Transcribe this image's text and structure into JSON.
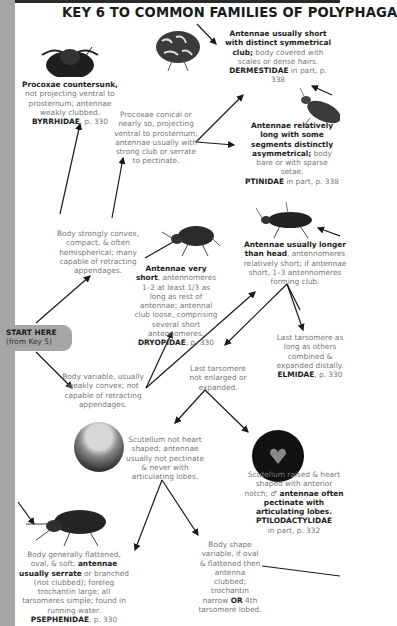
{
  "page": {
    "title": "KEY 6 TO COMMON FAMILIES OF POLYPHAGA",
    "colors": {
      "sidebar": "#a6a6a6",
      "text_bold": "#1c1c1c",
      "text_muted": "#777777",
      "arrow": "#1a1a1a"
    }
  },
  "start": {
    "label": "START HERE",
    "sub": "(from Key 5)"
  },
  "nodes": {
    "convex": "Body strongly convex, compact, & often hemispherical; many capable of retracting appendages.",
    "variable": "Body variable, usually weakly convex; not capable of retracting appendages.",
    "procoxae_conical": "Procoxae conical or nearly so, projecting ventral to prosternum; antennae usually with strong club or serrate to pectinate.",
    "byrrhidae": {
      "bold": "Procoxae countersunk,",
      "text": "not projecting ventral to prosternum; antennae weakly clubbed.",
      "family": "BYRRHIDAE",
      "page": ", p. 330"
    },
    "dermestidae": {
      "bold": "Antennae usually short with distinct symmetrical club;",
      "text": "body covered with scales or dense hairs.",
      "family": "DERMESTIDAE",
      "page": " in part, p. 338"
    },
    "ptinidae": {
      "bold": "Antennae relatively long with some segments distinctly asymmetrical;",
      "text": "body bare or with sparse setae.",
      "family": "PTINIDAE",
      "page": " in part, p. 338"
    },
    "dryopidae": {
      "bold": "Antennae very short",
      "text": ", antennomeres 1–2 at least 1/3 as long as rest of antennae; antennal club loose, comprising several short antennomeres.",
      "family": "DRYOPIDAE",
      "page": ", p. 330"
    },
    "antennae_longer": {
      "bold": "Antennae usually longer than head",
      "text": ", antennomeres relatively short; if antennae short, 1–3 antennomeres forming club."
    },
    "last_tarsomere_not": "Last tarsomere not enlarged or expanded.",
    "elmidae": {
      "text": "Last tarsomere as long as others combined & expanded distally.",
      "family": "ELMIDAE",
      "page": ", p. 330"
    },
    "scutellum_not_heart": "Scutellum not heart shaped; antennae usually not pectinate & never with articulating lobes.",
    "ptilodactylidae": {
      "text": "Scutellum raised & heart shaped with anterior notch;",
      "symbol": "♂",
      "bold": " antennae often pectinate with articulating lobes.",
      "family": "PTILODACTYLIDAE",
      "page": "in part, p. 332"
    },
    "psephenidae": {
      "text1": "Body generally flattened, oval, & soft;",
      "bold": " antennae usually serrate",
      "text2": " or branched (not clubbed); foreleg trochantin large; all tarsomeres simple; found in running water.",
      "family": "PSEPHENIDAE",
      "page": ", p. 330"
    },
    "body_shape_variable": {
      "text": "Body shape variable, if oval & flattened then antenna clubbed; trochantin narrow",
      "bold": " OR",
      "text2": " 4th tarsomere lobed."
    }
  },
  "illustrations": [
    "byrrhid-beetle",
    "dermestid-beetle",
    "ptinid-beetle",
    "dryopid-beetle",
    "elmid-beetle",
    "scutellum-plain-closeup",
    "scutellum-heart-closeup",
    "psephenid-beetle"
  ]
}
